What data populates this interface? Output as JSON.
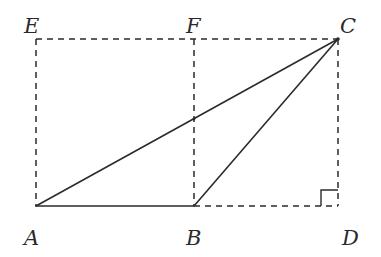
{
  "figure": {
    "points": {
      "E": {
        "label": "E",
        "x": 36,
        "y": 39
      },
      "F": {
        "label": "F",
        "x": 194,
        "y": 39
      },
      "C": {
        "label": "C",
        "x": 338,
        "y": 39
      },
      "A": {
        "label": "A",
        "x": 36,
        "y": 206
      },
      "B": {
        "label": "B",
        "x": 194,
        "y": 206
      },
      "D": {
        "label": "D",
        "x": 338,
        "y": 206
      }
    },
    "solid_segments": [
      [
        "A",
        "B"
      ],
      [
        "A",
        "C"
      ],
      [
        "B",
        "C"
      ]
    ],
    "dashed_segments": [
      [
        "E",
        "C"
      ],
      [
        "E",
        "A"
      ],
      [
        "F",
        "B"
      ],
      [
        "C",
        "D"
      ],
      [
        "B",
        "D"
      ]
    ],
    "right_angle_at": "D",
    "labels": {
      "E": "E",
      "F": "F",
      "C": "C",
      "A": "A",
      "B": "B",
      "D": "D"
    }
  }
}
